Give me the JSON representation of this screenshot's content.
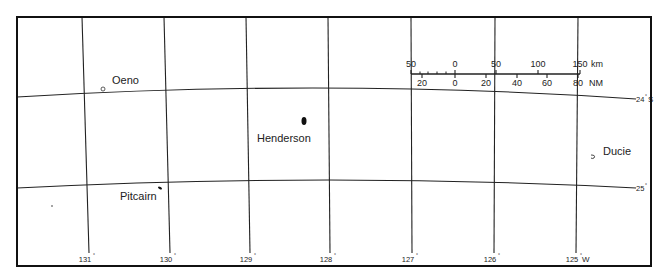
{
  "map": {
    "title": "Pitcairn Islands",
    "islands": [
      {
        "name": "Oeno",
        "label_x": 112,
        "label_y": 84,
        "mark_x": 103,
        "mark_y": 89
      },
      {
        "name": "Henderson",
        "label_x": 257,
        "label_y": 142,
        "mark_x": 304,
        "mark_y": 121
      },
      {
        "name": "Ducie",
        "label_x": 603,
        "label_y": 155,
        "mark_x": 593,
        "mark_y": 157
      },
      {
        "name": "Pitcairn",
        "label_x": 120,
        "label_y": 200,
        "mark_x": 160,
        "mark_y": 188
      }
    ],
    "longitudes": [
      {
        "label": "131",
        "top_x": 82,
        "bottom_x": 89
      },
      {
        "label": "130",
        "top_x": 164,
        "bottom_x": 170
      },
      {
        "label": "129",
        "top_x": 246,
        "bottom_x": 250
      },
      {
        "label": "128",
        "top_x": 328,
        "bottom_x": 330
      },
      {
        "label": "127",
        "top_x": 411,
        "bottom_x": 412
      },
      {
        "label": "126",
        "top_x": 495,
        "bottom_x": 494
      },
      {
        "label": "125",
        "top_x": 578,
        "bottom_x": 576,
        "suffix": "W"
      }
    ],
    "latitudes": [
      {
        "label": "24",
        "suffix": "S",
        "left_y": 97,
        "mid_y": 88,
        "right_y": 99
      },
      {
        "label": "25",
        "suffix": "",
        "left_y": 188,
        "mid_y": 180,
        "right_y": 188
      }
    ],
    "degree_symbol": "°",
    "scale_bar": {
      "km_labels": [
        "50",
        "0",
        "50",
        "100",
        "150"
      ],
      "km_unit": "km",
      "nm_labels": [
        "20",
        "0",
        "20",
        "40",
        "60",
        "80"
      ],
      "nm_unit": "NM"
    }
  }
}
